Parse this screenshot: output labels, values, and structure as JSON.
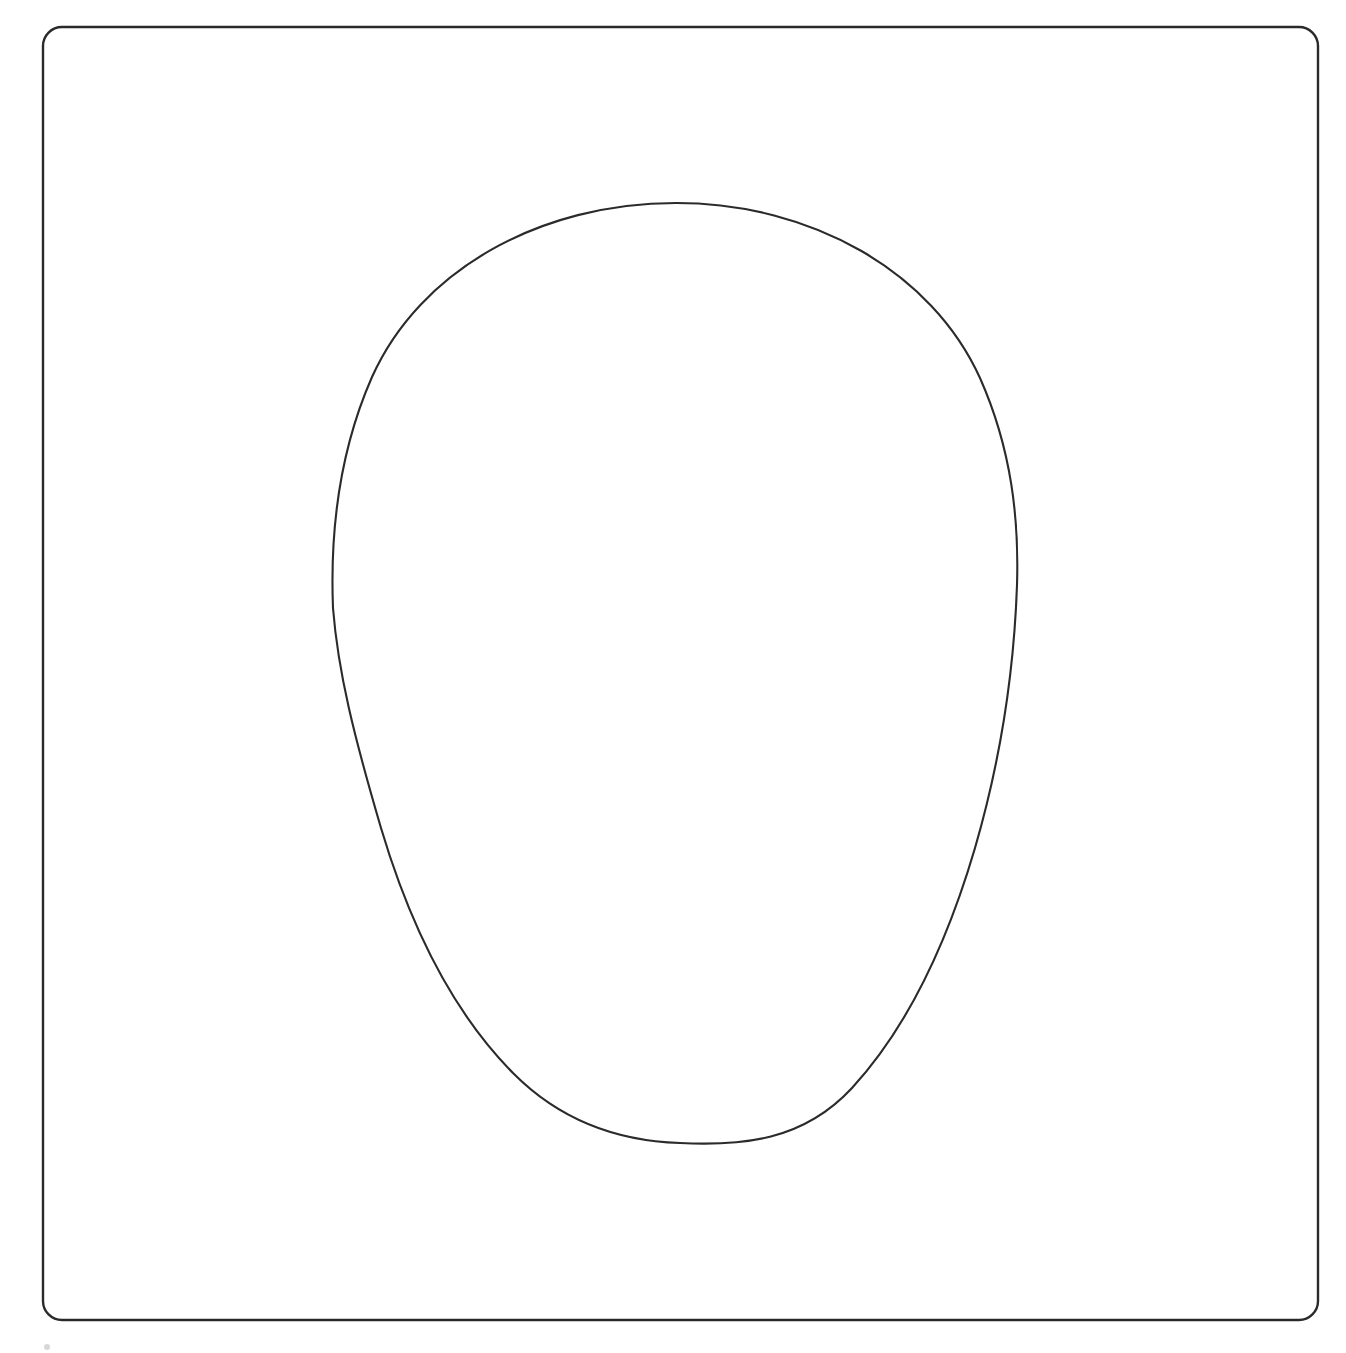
{
  "page": {
    "background_color": "#ffffff",
    "width": 1346,
    "height": 1353
  },
  "frame": {
    "name": "rounded-rectangle-border",
    "description": "Rounded rectangle frame enclosing the drawing",
    "stroke_color": "#2a2a2d",
    "fill_color": "none",
    "stroke_width": 2.4,
    "x": 43,
    "y": 27,
    "width": 1275,
    "height": 1293,
    "corner_radius": 19
  },
  "shape": {
    "name": "egg-outline",
    "description": "Egg / ovoid closed outline, wide blunt top and narrower rounded bottom",
    "stroke_color": "#2b2b2e",
    "fill_color": "none",
    "stroke_width": 2.1,
    "top_point": {
      "x": 676,
      "y": 203
    },
    "bottom_point": {
      "x": 680,
      "y": 1143
    },
    "leftmost_point": {
      "x": 332,
      "y": 610
    },
    "rightmost_point": {
      "x": 1017,
      "y": 585
    },
    "bounding_box": {
      "x": 332,
      "y": 203,
      "width": 685,
      "height": 940
    },
    "path": "M 676 203 C 812 203 932 272 980 378 C 1012 450 1019 520 1017 585 C 1014 672 1000 762 975 848 C 948 940 908 1027 852 1088 C 803 1141 742 1146 680 1143 C 618 1141 560 1120 514 1074 C 452 1012 409 922 381 828 C 354 736 338 672 333 608 C 330 532 339 452 372 377 C 420 270 540 203 676 203 Z"
  },
  "marks": [
    {
      "name": "bottom-left-speck",
      "description": "Faint small speck near lower left outside the frame",
      "x": 47,
      "y": 1347,
      "radius": 3,
      "color": "#d7d7d9"
    }
  ],
  "labels": {
    "alt_text": "Line drawing of an egg shape inside a rounded rectangular border"
  }
}
